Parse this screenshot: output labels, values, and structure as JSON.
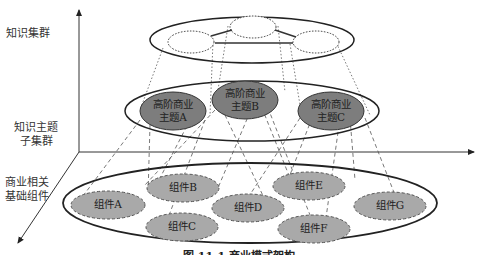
{
  "diagram": {
    "type": "layered-architecture",
    "colors": {
      "topic_fill": "#7d7d7d",
      "component_fill": "#a9a9a9",
      "line": "#222222",
      "background": "#ffffff"
    },
    "layers": [
      {
        "label": "知识集群"
      },
      {
        "label_line1": "知识主题",
        "label_line2": "子集群"
      },
      {
        "label_line1": "商业相关",
        "label_line2": "基础组件"
      }
    ],
    "topics": [
      {
        "line1": "高阶商业",
        "line2": "主题A"
      },
      {
        "line1": "高阶商业",
        "line2": "主题B"
      },
      {
        "line1": "高阶商业",
        "line2": "主题C"
      }
    ],
    "components": [
      {
        "label": "组件A"
      },
      {
        "label": "组件B"
      },
      {
        "label": "组件C"
      },
      {
        "label": "组件D"
      },
      {
        "label": "组件E"
      },
      {
        "label": "组件F"
      },
      {
        "label": "组件G"
      }
    ],
    "caption": "图 11-1 商业模式架构"
  }
}
